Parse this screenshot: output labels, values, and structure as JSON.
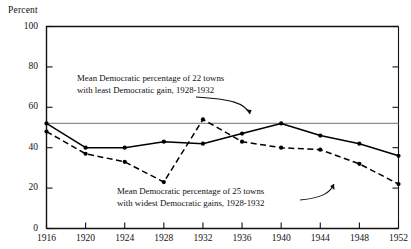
{
  "chart_data": {
    "type": "line",
    "title": "",
    "ylabel": "Percent",
    "xlabel": "",
    "x": [
      1916,
      1920,
      1924,
      1928,
      1932,
      1936,
      1940,
      1944,
      1948,
      1952
    ],
    "xtick_labels": [
      "1916",
      "1920",
      "1924",
      "1928",
      "1932",
      "1936",
      "1940",
      "1944",
      "1948",
      "1952"
    ],
    "ytick_labels": [
      "0",
      "20",
      "40",
      "60",
      "80",
      "100"
    ],
    "yticks": [
      0,
      20,
      40,
      60,
      80,
      100
    ],
    "ylim": [
      0,
      100
    ],
    "xlim": [
      1916,
      1952
    ],
    "grid": false,
    "legend_position": "none",
    "series": [
      {
        "name": "Mean Democratic percentage of 22 towns with least Democratic gain, 1928-1932",
        "style": "solid",
        "marker": "filled-circle",
        "color": "#000000",
        "values": [
          52,
          40,
          40,
          43,
          42,
          47,
          52,
          46,
          42,
          36
        ]
      },
      {
        "name": "Mean Democratic percentage of 25 towns with widest Democratic gains, 1928-1932",
        "style": "dashed",
        "marker": "filled-circle",
        "color": "#000000",
        "values": [
          48,
          37,
          33,
          23,
          54,
          43,
          40,
          39,
          32,
          22
        ]
      }
    ],
    "reference_line": {
      "orientation": "horizontal",
      "value": 52,
      "color": "#8d8d8d"
    },
    "annotations": [
      {
        "id": "annotation-upper",
        "line1": "Mean Democratic percentage of  22 towns",
        "line2": "with least Democratic gain, 1928-1932",
        "points_to_series": "22 towns"
      },
      {
        "id": "annotation-lower",
        "line1": "Mean Democratic percentage of  25 towns",
        "line2": "with widest Democratic gains, 1928-1932",
        "points_to_series": "25 towns"
      }
    ]
  }
}
